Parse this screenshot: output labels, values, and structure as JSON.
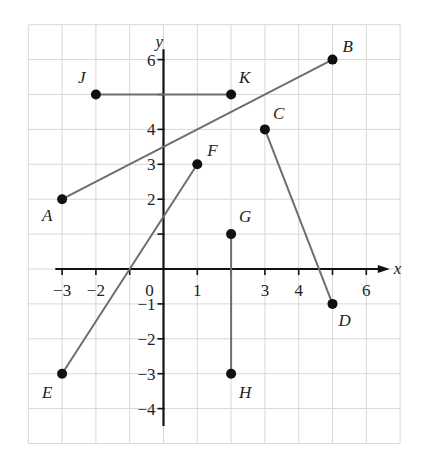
{
  "chart_data": {
    "type": "scatter",
    "title": "",
    "xlabel": "x",
    "ylabel": "y",
    "xlim": [
      -4,
      7
    ],
    "ylim": [
      -5,
      7
    ],
    "grid": true,
    "x_tick_labels": [
      {
        "value": -3,
        "label": "−3"
      },
      {
        "value": -2,
        "label": "−2"
      },
      {
        "value": 1,
        "label": "1"
      },
      {
        "value": 3,
        "label": "3"
      },
      {
        "value": 4,
        "label": "4"
      },
      {
        "value": 6,
        "label": "6"
      }
    ],
    "origin_label": "0",
    "y_tick_labels": [
      {
        "value": 6,
        "label": "6"
      },
      {
        "value": 4,
        "label": "4"
      },
      {
        "value": 3,
        "label": "3"
      },
      {
        "value": 2,
        "label": "2"
      },
      {
        "value": -1,
        "label": "−1"
      },
      {
        "value": -2,
        "label": "−2"
      },
      {
        "value": -3,
        "label": "−3"
      },
      {
        "value": -4,
        "label": "−4"
      }
    ],
    "points": [
      {
        "name": "A",
        "x": -3,
        "y": 2
      },
      {
        "name": "B",
        "x": 5,
        "y": 6
      },
      {
        "name": "C",
        "x": 3,
        "y": 4
      },
      {
        "name": "D",
        "x": 5,
        "y": -1
      },
      {
        "name": "E",
        "x": -3,
        "y": -3
      },
      {
        "name": "F",
        "x": 1,
        "y": 3
      },
      {
        "name": "G",
        "x": 2,
        "y": 1
      },
      {
        "name": "H",
        "x": 2,
        "y": -3
      },
      {
        "name": "J",
        "x": -2,
        "y": 5
      },
      {
        "name": "K",
        "x": 2,
        "y": 5
      }
    ],
    "segments": [
      {
        "name": "AB",
        "from": "A",
        "to": "B"
      },
      {
        "name": "CD",
        "from": "C",
        "to": "D"
      },
      {
        "name": "EF",
        "from": "E",
        "to": "F"
      },
      {
        "name": "GH",
        "from": "G",
        "to": "H"
      },
      {
        "name": "JK",
        "from": "J",
        "to": "K"
      }
    ]
  },
  "axes": {
    "x_label": "x",
    "y_label": "y"
  }
}
